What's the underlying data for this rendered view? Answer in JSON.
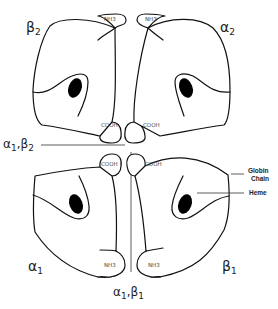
{
  "diagram": {
    "subunits": [
      {
        "id": "beta2",
        "label": "β",
        "subscript": "2",
        "position": "top-left",
        "n_terminus": "NH3",
        "c_terminus": "COOH"
      },
      {
        "id": "alpha2",
        "label": "α",
        "subscript": "2",
        "position": "top-right",
        "n_terminus": "NH3",
        "c_terminus": "COOH"
      },
      {
        "id": "alpha1",
        "label": "α",
        "subscript": "1",
        "position": "bottom-left",
        "n_terminus": "NH3",
        "c_terminus": "COOH"
      },
      {
        "id": "beta1",
        "label": "β",
        "subscript": "1",
        "position": "bottom-right",
        "n_terminus": "NH3",
        "c_terminus": "COOH"
      }
    ],
    "interfaces": [
      {
        "id": "a1b2",
        "label_a": "α",
        "sub_a": "1",
        "label_b": "β",
        "sub_b": "2",
        "orientation": "horizontal"
      },
      {
        "id": "a1b1",
        "label_a": "α",
        "sub_a": "1",
        "label_b": "β",
        "sub_b": "1",
        "orientation": "vertical"
      }
    ],
    "callouts": {
      "globin_line1": "Globin",
      "globin_line2": "Chain",
      "heme": "Heme"
    },
    "colors": {
      "stroke": "#111111",
      "heme": "#000000",
      "background": "#ffffff"
    }
  }
}
